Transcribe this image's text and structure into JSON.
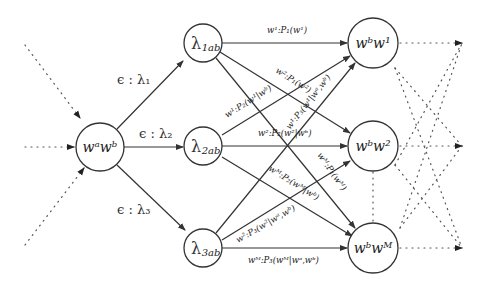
{
  "diagram": {
    "nodes": {
      "source": {
        "label": "wᵃwᵇ"
      },
      "l1": {
        "label": "λ",
        "sub": "1ab"
      },
      "l2": {
        "label": "λ",
        "sub": "2ab"
      },
      "l3": {
        "label": "λ",
        "sub": "3ab"
      },
      "t1": {
        "label": "wᵇw¹"
      },
      "t2": {
        "label": "wᵇw²"
      },
      "tM": {
        "label": "wᵇwᴹ"
      }
    },
    "epsilon_edges": {
      "e1": "ϵ : λ₁",
      "e2": "ϵ : λ₂",
      "e3": "ϵ : λ₃"
    },
    "weighted_edges": {
      "l1_t1": "w¹:P₁(w¹)",
      "l1_t2": "w²:P₁(w²)",
      "l2_t1": "w¹:P₂(w¹|wᵇ)",
      "l2_t2": "w²:P₂(w²|wᵇ)",
      "l2_tM": "wᴹ:P₂(wᴹ|wᵇ)",
      "l1_tM": "wᴹ:P₁(wᴹ)",
      "l3_t1": "w¹:P₃(w¹|wᵃ,wᵇ)",
      "l3_t2": "w²:P₃(w²|wᵃ,wᵇ)",
      "l3_tM": "wᴹ:P₃(wᴹ|wᵃ,wᵇ)"
    }
  }
}
